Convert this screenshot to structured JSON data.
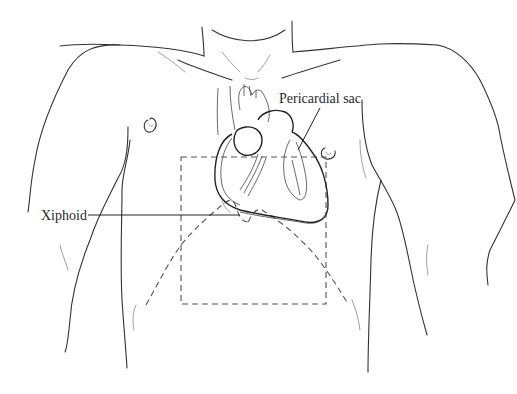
{
  "figure": {
    "type": "anatomical line illustration",
    "labels": {
      "pericardial_sac": "Pericardial sac",
      "xiphoid": "Xiphoid"
    },
    "colors": {
      "line": "#333333",
      "dashed_region": "#555555",
      "pericardium_fill": "#9a9a9a",
      "background": "#ffffff"
    },
    "annotations": [
      {
        "label": "Pericardial sac",
        "points_to": "outer layer of heart on right side of image"
      },
      {
        "label": "Xiphoid",
        "points_to": "xiphoid process below the heart"
      }
    ],
    "regions": [
      {
        "name": "dashed-square",
        "style": "dashed",
        "description": "Rectangular region over lower sternum / epigastrium"
      },
      {
        "name": "costal-margin",
        "style": "dashed",
        "description": "Inverted V outline of costal margins from xiphoid"
      }
    ]
  }
}
